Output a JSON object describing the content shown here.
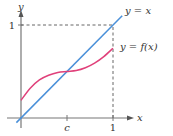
{
  "chart_data": {
    "type": "line",
    "title": "",
    "xlabel": "x",
    "ylabel": "y",
    "xlim": [
      0,
      1
    ],
    "ylim": [
      0,
      1
    ],
    "grid": false,
    "x_ticks": [
      {
        "value": 0.5,
        "label": "c"
      },
      {
        "value": 1,
        "label": "1"
      }
    ],
    "y_ticks": [
      {
        "value": 1,
        "label": "1"
      }
    ],
    "series": [
      {
        "name": "y = x",
        "color": "#4a90d9",
        "x": [
          -0.05,
          1.1
        ],
        "y": [
          -0.05,
          1.1
        ]
      },
      {
        "name": "y = f(x)",
        "color": "#e0407a",
        "x": [
          0,
          0.1,
          0.2,
          0.3,
          0.4,
          0.5,
          0.6,
          0.7,
          0.8,
          0.9,
          1.0
        ],
        "y": [
          0.19,
          0.32,
          0.41,
          0.46,
          0.49,
          0.5,
          0.51,
          0.54,
          0.59,
          0.66,
          0.75
        ]
      }
    ],
    "reference_lines": [
      {
        "type": "dashed",
        "from": [
          0,
          1
        ],
        "to": [
          1,
          1
        ]
      },
      {
        "type": "dashed",
        "from": [
          1,
          0
        ],
        "to": [
          1,
          1
        ]
      }
    ],
    "annotations": [
      "y = x",
      "y = f(x)"
    ]
  }
}
